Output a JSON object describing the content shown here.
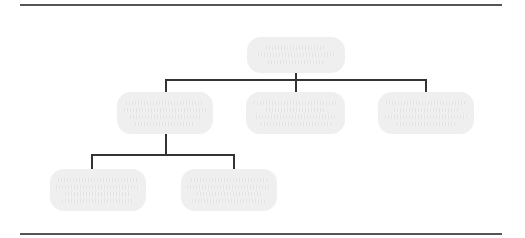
{
  "diagram": {
    "type": "org-chart",
    "colors": {
      "node_fill": "#efefef",
      "connector": "#333333",
      "rule": "#555555"
    },
    "nodes": [
      {
        "id": "root",
        "label": "",
        "text_legible": false,
        "level": 0
      },
      {
        "id": "child-1",
        "label": "",
        "text_legible": false,
        "level": 1,
        "parent": "root"
      },
      {
        "id": "child-2",
        "label": "",
        "text_legible": false,
        "level": 1,
        "parent": "root"
      },
      {
        "id": "child-3",
        "label": "",
        "text_legible": false,
        "level": 1,
        "parent": "root"
      },
      {
        "id": "grandchild-1",
        "label": "",
        "text_legible": false,
        "level": 2,
        "parent": "child-1"
      },
      {
        "id": "grandchild-2",
        "label": "",
        "text_legible": false,
        "level": 2,
        "parent": "child-1"
      }
    ]
  }
}
